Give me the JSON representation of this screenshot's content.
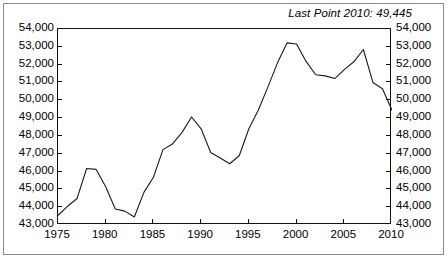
{
  "annotation": {
    "text": "Last Point 2010: 49,445"
  },
  "axes": {
    "y_tick_labels": [
      "54,000",
      "53,000",
      "52,000",
      "51,000",
      "50,000",
      "49,000",
      "48,000",
      "47,000",
      "46,000",
      "45,000",
      "44,000",
      "43,000"
    ],
    "x_tick_labels": [
      "1975",
      "1980",
      "1985",
      "1990",
      "1995",
      "2000",
      "2005",
      "2010"
    ]
  },
  "colors": {
    "line": "#1a1a1a",
    "frame": "#111111",
    "outer_frame": "#8a8a8a",
    "background": "#ffffff",
    "text": "#000000"
  },
  "chart_data": {
    "type": "line",
    "title": "",
    "subtitle": "",
    "xlabel": "",
    "ylabel": "",
    "xlim": [
      1975,
      2010
    ],
    "ylim": [
      43000,
      54000
    ],
    "grid": false,
    "legend": false,
    "legend_position": "none",
    "y_ticks": [
      43000,
      44000,
      45000,
      46000,
      47000,
      48000,
      49000,
      50000,
      51000,
      52000,
      53000,
      54000
    ],
    "x_ticks": [
      1975,
      1980,
      1985,
      1990,
      1995,
      2000,
      2005,
      2010
    ],
    "y_tick_format": "comma",
    "annotations": [
      {
        "text": "Last Point 2010: 49,445",
        "position": "top-right",
        "italic": true
      }
    ],
    "series": [
      {
        "name": "series-1",
        "x": [
          1975,
          1976,
          1977,
          1978,
          1979,
          1980,
          1981,
          1982,
          1983,
          1984,
          1985,
          1986,
          1987,
          1988,
          1989,
          1990,
          1991,
          1992,
          1993,
          1994,
          1995,
          1996,
          1997,
          1998,
          1999,
          2000,
          2001,
          2002,
          2003,
          2004,
          2005,
          2006,
          2007,
          2008,
          2009,
          2010
        ],
        "values": [
          43540,
          44050,
          44490,
          46170,
          46120,
          45150,
          43900,
          43780,
          43450,
          44830,
          45680,
          47230,
          47550,
          48200,
          49060,
          48400,
          47070,
          46760,
          46440,
          46900,
          48400,
          49450,
          50750,
          52100,
          53220,
          53160,
          52180,
          51430,
          51370,
          51220,
          51720,
          52160,
          52850,
          51000,
          50650,
          49445
        ]
      }
    ]
  }
}
